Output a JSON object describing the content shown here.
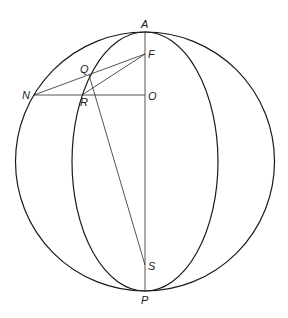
{
  "diagram": {
    "sphere": {
      "cx": 145,
      "cy": 161.5,
      "r": 129.5
    },
    "meridian_ellipse": {
      "cx": 145,
      "cy": 161.5,
      "rx": 73,
      "ry": 129.5
    },
    "points": {
      "A": {
        "label": "A",
        "x": 145,
        "y": 32
      },
      "P": {
        "label": "P",
        "x": 145,
        "y": 291
      },
      "F": {
        "label": "F",
        "x": 145,
        "y": 54
      },
      "O": {
        "label": "O",
        "x": 145,
        "y": 95
      },
      "N": {
        "label": "N",
        "x": 34,
        "y": 95
      },
      "Q": {
        "label": "Q",
        "x": 89,
        "y": 75
      },
      "R": {
        "label": "R",
        "x": 82,
        "y": 95
      },
      "S": {
        "label": "S",
        "x": 145,
        "y": 265
      }
    },
    "segments": [
      {
        "from": "A",
        "to": "P"
      },
      {
        "from": "N",
        "to": "O"
      },
      {
        "from": "N",
        "to": "F"
      },
      {
        "from": "R",
        "to": "F"
      },
      {
        "from": "Q",
        "to": "S"
      }
    ],
    "labels": {
      "A": "A",
      "P": "P",
      "F": "F",
      "O": "O",
      "N": "N",
      "Q": "Q",
      "R": "R",
      "S": "S"
    },
    "stroke_color": "#1a1a1a"
  }
}
